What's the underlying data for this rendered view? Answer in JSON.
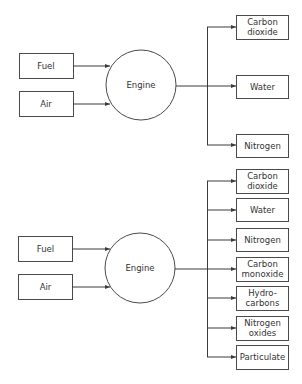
{
  "diagrams": [
    {
      "inputs": [
        "Fuel",
        "Air"
      ],
      "process": "Engine",
      "outputs": [
        [
          "Carbon",
          "dioxide"
        ],
        [
          "Water"
        ],
        [
          "Nitrogen"
        ]
      ]
    },
    {
      "inputs": [
        "Fuel",
        "Air"
      ],
      "process": "Engine",
      "outputs": [
        [
          "Carbon",
          "dioxide"
        ],
        [
          "Water"
        ],
        [
          "Nitrogen"
        ],
        [
          "Carbon",
          "monoxide"
        ],
        [
          "Hydro-",
          "carbons"
        ],
        [
          "Nitrogen",
          "oxides"
        ],
        [
          "Particulate"
        ]
      ]
    }
  ],
  "colors": {
    "line": "#3a3a3a",
    "text": "#333333",
    "background": "#ffffff"
  }
}
